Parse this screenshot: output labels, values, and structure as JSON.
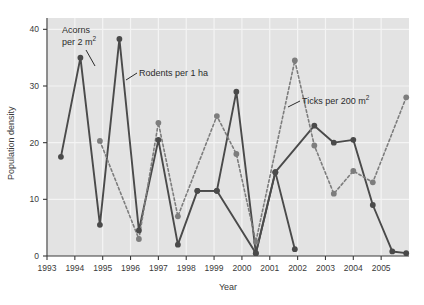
{
  "chart_data": {
    "type": "line",
    "title": "",
    "xlabel": "Year",
    "ylabel": "Population density",
    "xlim": [
      1993,
      2006
    ],
    "ylim": [
      0,
      42
    ],
    "yticks": [
      0,
      10,
      20,
      30,
      40
    ],
    "xticks": [
      1993,
      1994,
      1995,
      1996,
      1997,
      1998,
      1999,
      2000,
      2001,
      2002,
      2003,
      2004,
      2005
    ],
    "grid": true,
    "legend_position": "inline-annotations",
    "x": [
      1993.5,
      1994.0,
      1994.6,
      1995.5,
      1995.6,
      1996.5,
      1997.5,
      1998.5,
      1999.5,
      2000.5,
      2001.5,
      2002.5,
      2003.5,
      2004.5,
      2005.5
    ],
    "series": [
      {
        "name": "Acorns per 2 m2",
        "label": "Acorns",
        "label_unit": "per 2 m",
        "label_sup": "2",
        "color": "#4a4a4a",
        "style": "solid",
        "marker": "circle",
        "x": [
          1993.5,
          1994.5,
          1995.4,
          1996.4,
          1997.4,
          1998.4,
          1999.4,
          2000.4,
          2001.4,
          2002.4
        ],
        "values": [
          17.5,
          35.0,
          5.5,
          38.3,
          4.5,
          20.5,
          2.0,
          11.5,
          11.5,
          29.0
        ],
        "points": [
          {
            "x": 1993.5,
            "y": 17.5
          },
          {
            "x": 1994.2,
            "y": 35.0
          },
          {
            "x": 1994.9,
            "y": 5.5
          },
          {
            "x": 1995.6,
            "y": 38.3
          },
          {
            "x": 1996.3,
            "y": 4.5
          },
          {
            "x": 1997.0,
            "y": 20.5
          },
          {
            "x": 1997.7,
            "y": 2.0
          },
          {
            "x": 1998.4,
            "y": 11.5
          },
          {
            "x": 1999.1,
            "y": 11.5
          },
          {
            "x": 1999.8,
            "y": 29.0
          },
          {
            "x": 2000.5,
            "y": 0.5
          },
          {
            "x": 2001.2,
            "y": 14.8
          },
          {
            "x": 2001.9,
            "y": 1.2
          }
        ]
      },
      {
        "name": "Rodents per 1 ha",
        "label": "Rodents per 1 ha",
        "color": "#4a4a4a",
        "style": "solid",
        "marker": "circle",
        "points": [
          {
            "x": 1998.4,
            "y": 11.5
          },
          {
            "x": 1999.1,
            "y": 11.5
          },
          {
            "x": 2000.5,
            "y": 0.5
          },
          {
            "x": 2001.2,
            "y": 14.8
          },
          {
            "x": 2002.6,
            "y": 23.0
          },
          {
            "x": 2003.3,
            "y": 20.0
          },
          {
            "x": 2004.0,
            "y": 20.5
          },
          {
            "x": 2004.7,
            "y": 9.0
          },
          {
            "x": 2005.4,
            "y": 0.8
          },
          {
            "x": 2005.9,
            "y": 0.5
          }
        ]
      },
      {
        "name": "Ticks per 200 m2",
        "label": "Ticks per 200 m",
        "label_sup": "2",
        "color": "#7d7d7d",
        "style": "dashed",
        "marker": "circle",
        "points": [
          {
            "x": 1994.9,
            "y": 20.3
          },
          {
            "x": 1996.3,
            "y": 3.0
          },
          {
            "x": 1997.0,
            "y": 23.5
          },
          {
            "x": 1997.7,
            "y": 7.0
          },
          {
            "x": 1999.1,
            "y": 24.7
          },
          {
            "x": 1999.8,
            "y": 18.0
          },
          {
            "x": 2000.5,
            "y": 2.5
          },
          {
            "x": 2001.9,
            "y": 34.5
          },
          {
            "x": 2002.6,
            "y": 19.5
          },
          {
            "x": 2003.3,
            "y": 11.0
          },
          {
            "x": 2004.0,
            "y": 15.0
          },
          {
            "x": 2004.7,
            "y": 13.0
          },
          {
            "x": 2005.9,
            "y": 28.0
          }
        ]
      }
    ],
    "annotations": [
      {
        "id": "acorns",
        "line1": "Acorns",
        "line2": "per 2 m",
        "sup": "2"
      },
      {
        "id": "rodents",
        "line1": "Rodents per 1 ha",
        "sup": ""
      },
      {
        "id": "ticks",
        "line1": "Ticks per 200 m",
        "sup": "2"
      }
    ]
  },
  "axes": {
    "ylabel": "Population density",
    "xlabel": "Year",
    "ytick_labels": [
      "40",
      "30",
      "20",
      "10",
      "0"
    ],
    "xtick_labels": [
      "1993",
      "1994",
      "1995",
      "1996",
      "1997",
      "1998",
      "1999",
      "2000",
      "2001",
      "2002",
      "2003",
      "2004",
      "2005"
    ]
  },
  "style": {
    "plot_bg": "#e3e3e3",
    "grid_color": "#f4f4f4",
    "dark_series": "#4a4a4a",
    "light_series": "#7d7d7d",
    "text_color": "#3a3a3a"
  }
}
